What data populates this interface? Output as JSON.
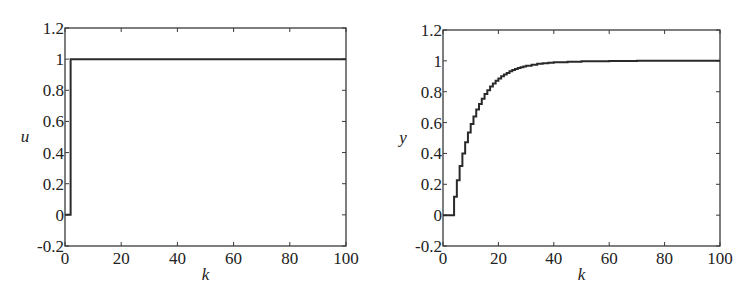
{
  "chart_data": [
    {
      "type": "line",
      "step": true,
      "title": "",
      "xlabel": "k",
      "ylabel": "u",
      "xlim": [
        0,
        100
      ],
      "ylim": [
        -0.2,
        1.2
      ],
      "xticks": [
        0,
        20,
        40,
        60,
        80,
        100
      ],
      "xtick_labels": [
        "0",
        "20",
        "40",
        "60",
        "80",
        "100"
      ],
      "yticks": [
        -0.2,
        0,
        0.2,
        0.4,
        0.6,
        0.8,
        1,
        1.2
      ],
      "ytick_labels": [
        "-0.2",
        "0",
        "0.2",
        "0.4",
        "0.6",
        "0.8",
        "1",
        "1.2"
      ],
      "grid": false,
      "legend": null,
      "series": [
        {
          "name": "u",
          "x": [
            0,
            1,
            2,
            100
          ],
          "values": [
            0,
            0,
            1,
            1
          ]
        }
      ]
    },
    {
      "type": "line",
      "step": true,
      "title": "",
      "xlabel": "k",
      "ylabel": "y",
      "xlim": [
        0,
        100
      ],
      "ylim": [
        -0.2,
        1.2
      ],
      "xticks": [
        0,
        20,
        40,
        60,
        80,
        100
      ],
      "xtick_labels": [
        "0",
        "20",
        "40",
        "60",
        "80",
        "100"
      ],
      "yticks": [
        -0.2,
        0,
        0.2,
        0.4,
        0.6,
        0.8,
        1,
        1.2
      ],
      "ytick_labels": [
        "-0.2",
        "0",
        "0.2",
        "0.4",
        "0.6",
        "0.8",
        "1",
        "1.2"
      ],
      "grid": false,
      "legend": null,
      "series": [
        {
          "name": "y",
          "x": [
            0,
            1,
            2,
            3,
            4,
            5,
            6,
            7,
            8,
            9,
            10,
            11,
            12,
            13,
            14,
            15,
            16,
            17,
            18,
            19,
            20,
            21,
            22,
            23,
            24,
            25,
            26,
            27,
            28,
            29,
            30,
            32,
            34,
            36,
            38,
            40,
            45,
            50,
            60,
            70,
            80,
            90,
            100
          ],
          "values": [
            0,
            0,
            0,
            0,
            0.12,
            0.226,
            0.319,
            0.4,
            0.472,
            0.536,
            0.591,
            0.64,
            0.684,
            0.721,
            0.755,
            0.785,
            0.81,
            0.833,
            0.853,
            0.871,
            0.886,
            0.9,
            0.912,
            0.922,
            0.932,
            0.94,
            0.947,
            0.953,
            0.959,
            0.964,
            0.968,
            0.975,
            0.981,
            0.985,
            0.988,
            0.991,
            0.995,
            0.998,
            0.999,
            1.0,
            1.0,
            1.0,
            1.0
          ]
        }
      ]
    }
  ],
  "panels": [
    {
      "frame": {
        "left": 65,
        "top": 28,
        "right": 346,
        "bottom": 246
      }
    },
    {
      "frame": {
        "left": 443,
        "top": 30,
        "right": 720,
        "bottom": 246
      }
    }
  ],
  "colors": {
    "line": "#2a2a2a",
    "frame": "#3a3a3a",
    "background": "#ffffff"
  }
}
